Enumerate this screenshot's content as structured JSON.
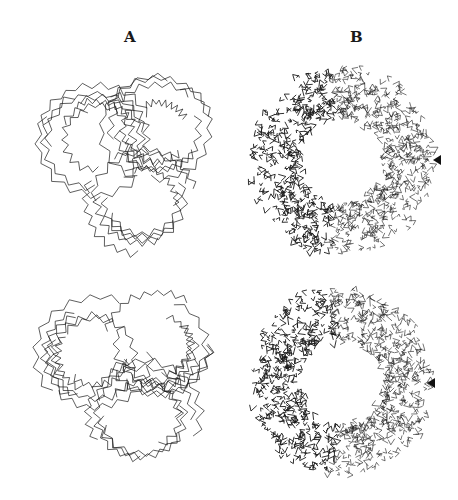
{
  "figure": {
    "panels": [
      {
        "id": "A",
        "label": "A",
        "description": "Backbone (C-alpha) trace, stereo pair"
      },
      {
        "id": "B",
        "label": "B",
        "description": "All-atom model, stereo pair"
      }
    ],
    "rows": [
      {
        "row": "top",
        "a_center": [
          128,
          155
        ],
        "b_center": [
          345,
          160
        ],
        "arrow": [
          437,
          160
        ]
      },
      {
        "row": "bottom",
        "a_center": [
          128,
          370
        ],
        "b_center": [
          345,
          382
        ],
        "arrow": [
          431,
          383
        ]
      }
    ],
    "markers": {
      "arrowhead": "arrowhead-left-icon"
    },
    "colors": {
      "ink": "#1a1a1a",
      "background": "#ffffff"
    }
  }
}
